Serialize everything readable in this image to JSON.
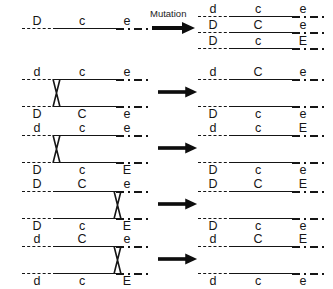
{
  "figure": {
    "mutation_label": "Mutation",
    "ink_color": "#151515",
    "arrow_color": "#0d0d0d"
  },
  "loci": [
    "D",
    "C",
    "E"
  ],
  "panels": [
    {
      "id": "mutation-panel",
      "operation": "mutation",
      "operator_label": "Mutation",
      "parent": {
        "chromosomes": [
          {
            "alleles": [
              "D",
              "c",
              "e"
            ],
            "label_position": "above"
          }
        ]
      },
      "products": {
        "chromosomes": [
          {
            "alleles": [
              "d",
              "c",
              "e"
            ],
            "label_position": "above"
          },
          {
            "alleles": [
              "D",
              "C",
              "e"
            ],
            "label_position": "above"
          },
          {
            "alleles": [
              "D",
              "c",
              "E"
            ],
            "label_position": "above"
          }
        ]
      }
    },
    {
      "id": "crossover-panel-1",
      "operation": "crossing-over",
      "operator_label": "",
      "crossover_locus": "between-D-and-C",
      "parent": {
        "chromosomes": [
          {
            "alleles": [
              "d",
              "c",
              "e"
            ],
            "label_position": "above"
          },
          {
            "alleles": [
              "D",
              "C",
              "e"
            ],
            "label_position": "below"
          }
        ]
      },
      "products": {
        "chromosomes": [
          {
            "alleles": [
              "d",
              "C",
              "e"
            ],
            "label_position": "above"
          },
          {
            "alleles": [
              "D",
              "c",
              "e"
            ],
            "label_position": "below"
          }
        ]
      }
    },
    {
      "id": "crossover-panel-2",
      "operation": "crossing-over",
      "operator_label": "",
      "crossover_locus": "between-D-and-C",
      "parent": {
        "chromosomes": [
          {
            "alleles": [
              "d",
              "c",
              "e"
            ],
            "label_position": "above"
          },
          {
            "alleles": [
              "D",
              "c",
              "E"
            ],
            "label_position": "below"
          }
        ]
      },
      "products": {
        "chromosomes": [
          {
            "alleles": [
              "d",
              "c",
              "E"
            ],
            "label_position": "above"
          },
          {
            "alleles": [
              "D",
              "c",
              "e"
            ],
            "label_position": "below"
          }
        ]
      }
    },
    {
      "id": "crossover-panel-3",
      "operation": "crossing-over",
      "operator_label": "",
      "crossover_locus": "between-C-and-E",
      "parent": {
        "chromosomes": [
          {
            "alleles": [
              "D",
              "C",
              "e"
            ],
            "label_position": "above"
          },
          {
            "alleles": [
              "D",
              "c",
              "E"
            ],
            "label_position": "below"
          }
        ]
      },
      "products": {
        "chromosomes": [
          {
            "alleles": [
              "D",
              "C",
              "E"
            ],
            "label_position": "above"
          },
          {
            "alleles": [
              "D",
              "c",
              "e"
            ],
            "label_position": "below"
          }
        ]
      }
    },
    {
      "id": "crossover-panel-4",
      "operation": "crossing-over",
      "operator_label": "",
      "crossover_locus": "between-C-and-E",
      "parent": {
        "chromosomes": [
          {
            "alleles": [
              "d",
              "C",
              "e"
            ],
            "label_position": "above"
          },
          {
            "alleles": [
              "d",
              "c",
              "E"
            ],
            "label_position": "below"
          }
        ]
      },
      "products": {
        "chromosomes": [
          {
            "alleles": [
              "d",
              "C",
              "E"
            ],
            "label_position": "above"
          },
          {
            "alleles": [
              "d",
              "c",
              "e"
            ],
            "label_position": "below"
          }
        ]
      }
    }
  ],
  "layout": {
    "left_column_x": 22,
    "left_column_width": 128,
    "right_column_x": 198,
    "right_column_width": 128,
    "allele_offsets_pct": [
      12,
      47,
      82
    ],
    "crossover_x_pct_left": 26,
    "crossover_x_pct_right": 78
  }
}
